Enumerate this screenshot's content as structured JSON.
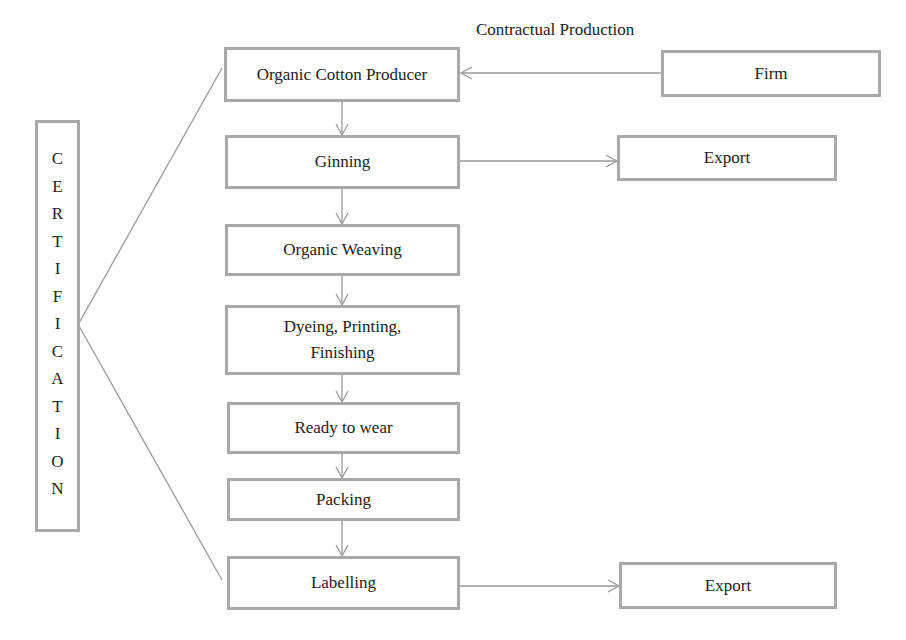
{
  "diagram": {
    "side_label": {
      "text": "CERTIFICATION",
      "letters": [
        "C",
        "E",
        "R",
        "T",
        "I",
        "F",
        "I",
        "C",
        "A",
        "T",
        "I",
        "O",
        "N"
      ]
    },
    "annotation": "Contractual Production",
    "nodes": {
      "firm": "Firm",
      "organic_cotton_producer": "Organic Cotton Producer",
      "ginning": "Ginning",
      "export_1": "Export",
      "organic_weaving": "Organic Weaving",
      "dyeing_line1": "Dyeing, Printing,",
      "dyeing_line2": "Finishing",
      "ready_to_wear": "Ready to wear",
      "packing": "Packing",
      "labelling": "Labelling",
      "export_2": "Export"
    },
    "edges": [
      {
        "from": "Firm",
        "to": "Organic Cotton Producer",
        "label": "Contractual Production"
      },
      {
        "from": "Organic Cotton Producer",
        "to": "Ginning"
      },
      {
        "from": "Ginning",
        "to": "Export"
      },
      {
        "from": "Ginning",
        "to": "Organic Weaving"
      },
      {
        "from": "Organic Weaving",
        "to": "Dyeing, Printing, Finishing"
      },
      {
        "from": "Dyeing, Printing, Finishing",
        "to": "Ready to wear"
      },
      {
        "from": "Ready to wear",
        "to": "Packing"
      },
      {
        "from": "Packing",
        "to": "Labelling"
      },
      {
        "from": "Labelling",
        "to": "Export"
      },
      {
        "from": "CERTIFICATION",
        "to": "Organic Cotton Producer",
        "style": "line"
      },
      {
        "from": "CERTIFICATION",
        "to": "Labelling",
        "style": "line"
      }
    ],
    "colors": {
      "border": "#a9a9a9",
      "line": "#9a9a9a",
      "text": "#222222"
    }
  }
}
